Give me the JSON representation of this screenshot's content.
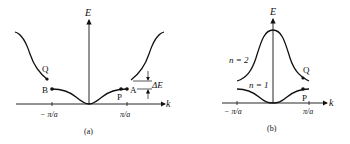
{
  "figure": {
    "panel_a": {
      "caption": "(a)",
      "y_axis_label": "E",
      "x_axis_label": "k",
      "tick_left": "− π/a",
      "tick_right": "π/a",
      "point_labels": {
        "Q": "Q",
        "B": "B",
        "P": "P",
        "A": "A"
      },
      "gap_label": "ΔE"
    },
    "panel_b": {
      "caption": "(b)",
      "y_axis_label": "E",
      "x_axis_label": "k",
      "tick_left": "− π/a",
      "tick_right": "π/a",
      "band_upper": "n = 2",
      "band_lower": "n = 1",
      "point_labels": {
        "Q": "Q",
        "P": "P"
      }
    },
    "colors": {
      "ink": "#111111",
      "background": "#ffffff"
    }
  }
}
